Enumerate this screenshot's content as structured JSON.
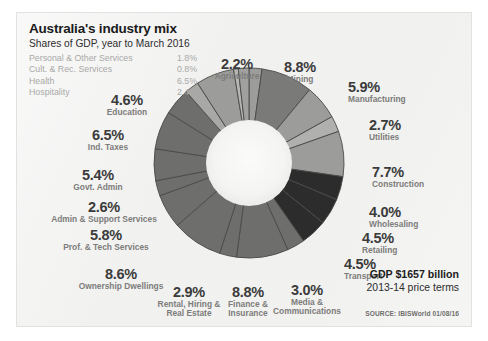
{
  "card": {
    "title": "Australia's industry mix",
    "subtitle": "Shares of GDP, year to March 2016",
    "legend": [
      {
        "label": "Personal & Other Services",
        "value": "1.8%"
      },
      {
        "label": "Cult. & Rec. Services",
        "value": "0.8%"
      },
      {
        "label": "Health",
        "value": "6.5%"
      },
      {
        "label": "Hospitality",
        "value": "2.4%"
      }
    ],
    "gdp_headline": "GDP $1657 billion",
    "gdp_subline": "2013-14 price terms",
    "source": "SOURCE: IBISWorld 01/08/16"
  },
  "chart_data": {
    "type": "pie",
    "variant": "donut",
    "title": "Australia's industry mix",
    "subtitle": "Shares of GDP, year to March 2016",
    "units": "percent of GDP",
    "start_angle_deg": -90,
    "direction": "clockwise",
    "inner_radius_ratio": 0.44,
    "total_labelled": 100.0,
    "categories": [
      "Agriculture",
      "Mining",
      "Manufacturing",
      "Utilities",
      "Construction",
      "Wholesaling",
      "Retailing",
      "Transport",
      "Media & Communications",
      "Finance & Insurance",
      "Rental, Hiring & Real Estate",
      "Ownership Dwellings",
      "Prof. & Tech Services",
      "Admin & Support Services",
      "Govt. Admin",
      "Ind. Taxes",
      "Education",
      "Hospitality",
      "Health",
      "Cult. & Rec. Services",
      "Personal & Other Services"
    ],
    "values": [
      2.2,
      8.8,
      5.9,
      2.7,
      7.7,
      4.0,
      4.5,
      4.5,
      3.0,
      8.8,
      2.9,
      8.6,
      5.8,
      2.6,
      5.4,
      6.5,
      4.6,
      2.4,
      6.5,
      0.8,
      1.8
    ],
    "slice_colors": [
      "#9c9c9a",
      "#7a7a78",
      "#9c9c9a",
      "#b0b0ae",
      "#9c9c9a",
      "#2c2c2c",
      "#2c2c2c",
      "#2c2c2c",
      "#6e6e6c",
      "#6e6e6c",
      "#6e6e6c",
      "#6e6e6c",
      "#6e6e6c",
      "#6e6e6c",
      "#6e6e6c",
      "#6e6e6c",
      "#6e6e6c",
      "#a8a8a6",
      "#9c9c9a",
      "#b6b6b4",
      "#a0a09e"
    ],
    "callouts": [
      {
        "pct": "2.2%",
        "name": "Agriculture",
        "side": "center",
        "x": 220,
        "y": 44
      },
      {
        "pct": "8.8%",
        "name": "Mining",
        "side": "center",
        "x": 283,
        "y": 47
      },
      {
        "pct": "5.9%",
        "name": "Manufacturing",
        "side": "right",
        "x": 331,
        "y": 67
      },
      {
        "pct": "2.7%",
        "name": "Utilities",
        "side": "right",
        "x": 352,
        "y": 105
      },
      {
        "pct": "7.7%",
        "name": "Construction",
        "side": "right",
        "x": 355,
        "y": 152
      },
      {
        "pct": "4.0%",
        "name": "Wholesaling",
        "side": "right",
        "x": 352,
        "y": 192
      },
      {
        "pct": "4.5%",
        "name": "Retailing",
        "side": "right",
        "x": 345,
        "y": 218
      },
      {
        "pct": "4.5%",
        "name": "Transport",
        "side": "right",
        "x": 327,
        "y": 244
      },
      {
        "pct": "3.0%",
        "name": "Media &\nCommunications",
        "side": "center",
        "x": 290,
        "y": 270
      },
      {
        "pct": "8.8%",
        "name": "Finance &\nInsurance",
        "side": "center",
        "x": 231,
        "y": 272
      },
      {
        "pct": "2.9%",
        "name": "Rental, Hiring &\nReal Estate",
        "side": "center",
        "x": 172,
        "y": 272
      },
      {
        "pct": "8.6%",
        "name": "Ownership Dwellings",
        "side": "center",
        "x": 104,
        "y": 254
      },
      {
        "pct": "5.8%",
        "name": "Prof. & Tech Services",
        "side": "center",
        "x": 89,
        "y": 215
      },
      {
        "pct": "2.6%",
        "name": "Admin & Support Services",
        "side": "center",
        "x": 87,
        "y": 187
      },
      {
        "pct": "5.4%",
        "name": "Govt. Admin",
        "side": "center",
        "x": 81,
        "y": 155
      },
      {
        "pct": "6.5%",
        "name": "Ind. Taxes",
        "side": "center",
        "x": 91,
        "y": 115
      },
      {
        "pct": "4.6%",
        "name": "Education",
        "side": "center",
        "x": 110,
        "y": 80
      }
    ],
    "legend_only": [
      {
        "label": "Personal & Other Services",
        "value": "1.8%"
      },
      {
        "label": "Cult. & Rec. Services",
        "value": "0.8%"
      },
      {
        "label": "Health",
        "value": "6.5%"
      },
      {
        "label": "Hospitality",
        "value": "2.4%"
      }
    ],
    "annotations": [
      "GDP $1657 billion",
      "2013-14 price terms",
      "SOURCE: IBISWorld 01/08/16"
    ],
    "legend_position": "top-left",
    "grid": false
  },
  "colors": {
    "card_background": "#f1f1f0",
    "page_background": "#ffffff",
    "title_text": "#1b1b1b",
    "legend_text": "#a9a9a7",
    "callout_pct": "#3b3b3b",
    "callout_name": "#7d7d7b",
    "donut_hole": "#f3f3f2",
    "slice_stroke": "#4a4a48"
  }
}
